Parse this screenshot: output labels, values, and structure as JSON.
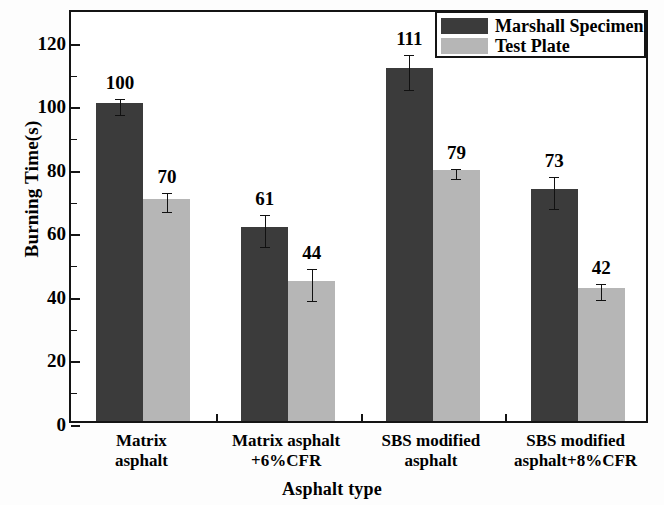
{
  "chart_data": {
    "type": "bar",
    "title": "",
    "subtitle": "",
    "xlabel": "Asphalt type",
    "ylabel": "Burning Time(s)",
    "ylim": [
      0,
      130
    ],
    "ytick_major": [
      0,
      20,
      40,
      60,
      80,
      100,
      120
    ],
    "ytick_minor": [
      10,
      30,
      50,
      70,
      90,
      110
    ],
    "ytick_labels": [
      "0",
      "20",
      "40",
      "60",
      "80",
      "100",
      "120"
    ],
    "grid": false,
    "legend_position": "top-right",
    "categories": [
      "Matrix\nasphalt",
      "Matrix asphalt\n+6%CFR",
      "SBS modified\nasphalt",
      "SBS modified\nasphalt+8%CFR"
    ],
    "series": [
      {
        "name": "Marshall Specimen",
        "color": "#3b3b3b",
        "values": [
          100,
          61,
          111,
          73
        ],
        "value_labels": [
          "100",
          "61",
          "111",
          "73"
        ],
        "errors": [
          2.5,
          5.0,
          5.5,
          5.0
        ]
      },
      {
        "name": "Test Plate",
        "color": "#b6b6b6",
        "values": [
          70,
          44,
          79,
          42
        ],
        "value_labels": [
          "70",
          "44",
          "79",
          "42"
        ],
        "errors": [
          3.0,
          5.0,
          1.5,
          2.5
        ]
      }
    ]
  },
  "legend": {
    "items": [
      {
        "label": "Marshall Specimen",
        "swatch": "dark"
      },
      {
        "label": "Test Plate",
        "swatch": "light"
      }
    ]
  },
  "axes": {
    "y_title": "Burning Time(s)",
    "x_title": "Asphalt type"
  }
}
